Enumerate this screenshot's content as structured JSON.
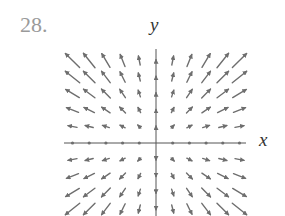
{
  "figure": {
    "problem_number": "28.",
    "x_axis_label": "x",
    "y_axis_label": "y",
    "colors": {
      "arrow": "#6e6e6e",
      "axis": "#555555",
      "problem_number": "#9a9a9a",
      "axis_label": "#333333"
    }
  },
  "chart_data": {
    "type": "vector_field",
    "title": "28.",
    "xlabel": "x",
    "ylabel": "y",
    "grid": {
      "x_range": [
        -5,
        5
      ],
      "y_range": [
        -4,
        5
      ],
      "origin_px": [
        156,
        143
      ],
      "spacing_px": [
        16.7,
        16.5
      ],
      "vector_scale_px": 20,
      "x_axis_px": [
        64,
        246
      ],
      "y_axis_px": [
        49,
        216
      ]
    },
    "vectors": [
      [
        -5,
        5,
        -0.71,
        0.71
      ],
      [
        -4,
        5,
        -0.58,
        0.72
      ],
      [
        -3,
        5,
        -0.41,
        0.68
      ],
      [
        -2,
        5,
        -0.24,
        0.6
      ],
      [
        -1,
        5,
        -0.09,
        0.45
      ],
      [
        0,
        5,
        0,
        0.08
      ],
      [
        1,
        5,
        0.09,
        0.45
      ],
      [
        2,
        5,
        0.24,
        0.6
      ],
      [
        3,
        5,
        0.41,
        0.68
      ],
      [
        4,
        5,
        0.58,
        0.72
      ],
      [
        5,
        5,
        0.71,
        0.71
      ],
      [
        -5,
        4,
        -0.72,
        0.58
      ],
      [
        -4,
        4,
        -0.58,
        0.58
      ],
      [
        -3,
        4,
        -0.43,
        0.57
      ],
      [
        -2,
        4,
        -0.26,
        0.52
      ],
      [
        -1,
        4,
        -0.1,
        0.4
      ],
      [
        0,
        4,
        0,
        0.08
      ],
      [
        1,
        4,
        0.1,
        0.4
      ],
      [
        2,
        4,
        0.26,
        0.52
      ],
      [
        3,
        4,
        0.43,
        0.57
      ],
      [
        4,
        4,
        0.58,
        0.58
      ],
      [
        5,
        4,
        0.72,
        0.58
      ],
      [
        -5,
        3,
        -0.68,
        0.41
      ],
      [
        -4,
        3,
        -0.57,
        0.43
      ],
      [
        -3,
        3,
        -0.44,
        0.44
      ],
      [
        -2,
        3,
        -0.28,
        0.42
      ],
      [
        -1,
        3,
        -0.11,
        0.34
      ],
      [
        0,
        3,
        0,
        0.07
      ],
      [
        1,
        3,
        0.11,
        0.34
      ],
      [
        2,
        3,
        0.28,
        0.42
      ],
      [
        3,
        3,
        0.44,
        0.44
      ],
      [
        4,
        3,
        0.57,
        0.43
      ],
      [
        5,
        3,
        0.68,
        0.41
      ],
      [
        -5,
        2,
        -0.6,
        0.24
      ],
      [
        -4,
        2,
        -0.52,
        0.26
      ],
      [
        -3,
        2,
        -0.42,
        0.28
      ],
      [
        -2,
        2,
        -0.29,
        0.29
      ],
      [
        -1,
        2,
        -0.13,
        0.26
      ],
      [
        0,
        2,
        0,
        0.06
      ],
      [
        1,
        2,
        0.13,
        0.26
      ],
      [
        2,
        2,
        0.29,
        0.29
      ],
      [
        3,
        2,
        0.42,
        0.28
      ],
      [
        4,
        2,
        0.52,
        0.26
      ],
      [
        5,
        2,
        0.6,
        0.24
      ],
      [
        -5,
        1,
        -0.45,
        0.09
      ],
      [
        -4,
        1,
        -0.4,
        0.1
      ],
      [
        -3,
        1,
        -0.34,
        0.11
      ],
      [
        -2,
        1,
        -0.26,
        0.13
      ],
      [
        -1,
        1,
        -0.15,
        0.15
      ],
      [
        0,
        1,
        0,
        0.05
      ],
      [
        1,
        1,
        0.15,
        0.15
      ],
      [
        2,
        1,
        0.26,
        0.13
      ],
      [
        3,
        1,
        0.34,
        0.11
      ],
      [
        4,
        1,
        0.4,
        0.1
      ],
      [
        5,
        1,
        0.45,
        0.09
      ],
      [
        -5,
        0,
        0,
        0
      ],
      [
        -4,
        0,
        0,
        0
      ],
      [
        -3,
        0,
        0,
        0
      ],
      [
        -2,
        0,
        0,
        0
      ],
      [
        -1,
        0,
        0,
        0
      ],
      [
        1,
        0,
        0,
        0
      ],
      [
        2,
        0,
        0,
        0
      ],
      [
        3,
        0,
        0,
        0
      ],
      [
        4,
        0,
        0,
        0
      ],
      [
        5,
        0,
        0,
        0
      ],
      [
        -5,
        -1,
        -0.45,
        -0.09
      ],
      [
        -4,
        -1,
        -0.4,
        -0.1
      ],
      [
        -3,
        -1,
        -0.34,
        -0.11
      ],
      [
        -2,
        -1,
        -0.26,
        -0.13
      ],
      [
        -1,
        -1,
        -0.15,
        -0.15
      ],
      [
        0,
        -1,
        0,
        -0.05
      ],
      [
        1,
        -1,
        0.15,
        -0.15
      ],
      [
        2,
        -1,
        0.26,
        -0.13
      ],
      [
        3,
        -1,
        0.34,
        -0.11
      ],
      [
        4,
        -1,
        0.4,
        -0.1
      ],
      [
        5,
        -1,
        0.45,
        -0.09
      ],
      [
        -5,
        -2,
        -0.6,
        -0.24
      ],
      [
        -4,
        -2,
        -0.52,
        -0.26
      ],
      [
        -3,
        -2,
        -0.42,
        -0.28
      ],
      [
        -2,
        -2,
        -0.29,
        -0.29
      ],
      [
        -1,
        -2,
        -0.13,
        -0.26
      ],
      [
        0,
        -2,
        0,
        -0.06
      ],
      [
        1,
        -2,
        0.13,
        -0.26
      ],
      [
        2,
        -2,
        0.29,
        -0.29
      ],
      [
        3,
        -2,
        0.42,
        -0.28
      ],
      [
        4,
        -2,
        0.52,
        -0.26
      ],
      [
        5,
        -2,
        0.6,
        -0.24
      ],
      [
        -5,
        -3,
        -0.68,
        -0.41
      ],
      [
        -4,
        -3,
        -0.57,
        -0.43
      ],
      [
        -3,
        -3,
        -0.44,
        -0.44
      ],
      [
        -2,
        -3,
        -0.28,
        -0.42
      ],
      [
        -1,
        -3,
        -0.11,
        -0.34
      ],
      [
        0,
        -3,
        0,
        -0.07
      ],
      [
        1,
        -3,
        0.11,
        -0.34
      ],
      [
        2,
        -3,
        0.28,
        -0.42
      ],
      [
        3,
        -3,
        0.44,
        -0.44
      ],
      [
        4,
        -3,
        0.57,
        -0.43
      ],
      [
        5,
        -3,
        0.68,
        -0.41
      ],
      [
        -5,
        -4,
        -0.72,
        -0.58
      ],
      [
        -4,
        -4,
        -0.58,
        -0.58
      ],
      [
        -3,
        -4,
        -0.43,
        -0.57
      ],
      [
        -2,
        -4,
        -0.26,
        -0.52
      ],
      [
        -1,
        -4,
        -0.1,
        -0.4
      ],
      [
        0,
        -4,
        0,
        -0.08
      ],
      [
        1,
        -4,
        0.1,
        -0.4
      ],
      [
        2,
        -4,
        0.26,
        -0.52
      ],
      [
        3,
        -4,
        0.43,
        -0.57
      ],
      [
        4,
        -4,
        0.58,
        -0.58
      ],
      [
        5,
        -4,
        0.72,
        -0.58
      ]
    ]
  }
}
